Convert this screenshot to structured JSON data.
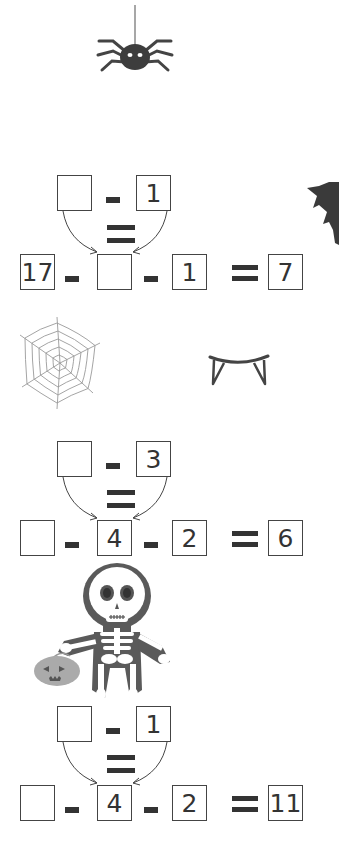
{
  "decorations": {
    "spider": "spider-icon",
    "bat": "bat-wing-icon",
    "spider_web": "spider-web-icon",
    "fangs": "vampire-fangs-icon",
    "skeleton": "skeleton-icon",
    "pumpkin": "jack-o-lantern-bucket-icon"
  },
  "colors": {
    "ink": "#333333",
    "box_border": "#444444",
    "web": "#9a9a9a",
    "pumpkin": "#aaaaaa",
    "skeleton_outline": "#5a5a5a"
  },
  "problems": [
    {
      "top": {
        "a": "",
        "op": "-",
        "b": "1"
      },
      "bottom": {
        "a": "17",
        "op1": "-",
        "b": "",
        "op2": "-",
        "c": "1",
        "eq": "=",
        "result": "7"
      }
    },
    {
      "top": {
        "a": "",
        "op": "-",
        "b": "3"
      },
      "bottom": {
        "a": "",
        "op1": "-",
        "b": "4",
        "op2": "-",
        "c": "2",
        "eq": "=",
        "result": "6"
      }
    },
    {
      "top": {
        "a": "",
        "op": "-",
        "b": "1"
      },
      "bottom": {
        "a": "",
        "op1": "-",
        "b": "4",
        "op2": "-",
        "c": "2",
        "eq": "=",
        "result": "11"
      }
    }
  ]
}
